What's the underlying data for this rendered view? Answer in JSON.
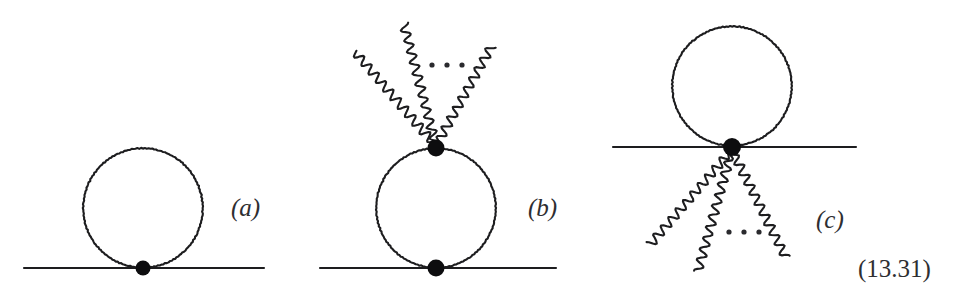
{
  "figure": {
    "kind": "feynman-diagram-figure",
    "equation_number": "(13.31)",
    "background_color": "#ffffff",
    "ink_color": "#1d1d1f",
    "vertex_color": "#0d0d0f",
    "width": 957,
    "height": 303,
    "panels": [
      {
        "id": "a",
        "label": "(a)",
        "description": "tadpole: fermion loop attached to a straight propagator line at a single vertex",
        "straight_line": {
          "x1": 24,
          "y1": 268,
          "x2": 264,
          "y2": 268
        },
        "loop": {
          "cx": 143,
          "cy": 208,
          "r": 60
        },
        "vertices": [
          {
            "cx": 143,
            "cy": 268,
            "r": 7.5
          }
        ],
        "wavy_lines": [],
        "ellipsis": null
      },
      {
        "id": "b",
        "label": "(b)",
        "description": "bubble loop on a propagator line with multiple photon lines radiating upward from the top vertex",
        "straight_line": {
          "x1": 320,
          "y1": 268,
          "x2": 556,
          "y2": 268
        },
        "loop": {
          "cx": 436,
          "cy": 208,
          "r": 60
        },
        "vertices": [
          {
            "cx": 436,
            "cy": 148,
            "r": 8.5
          },
          {
            "cx": 436,
            "cy": 268,
            "r": 8.5
          }
        ],
        "wavy_lines": [
          {
            "x1": 436,
            "y1": 146,
            "x2": 355,
            "y2": 52
          },
          {
            "x1": 436,
            "y1": 146,
            "x2": 404,
            "y2": 24
          },
          {
            "x1": 436,
            "y1": 146,
            "x2": 492,
            "y2": 46
          }
        ],
        "ellipsis": {
          "cx": 447,
          "cy": 65,
          "dots": 3,
          "spacing": 15,
          "r": 2.6
        }
      },
      {
        "id": "c",
        "label": "(c)",
        "description": "tadpole loop above a propagator line with multiple photon lines radiating downward from the vertex",
        "straight_line": {
          "x1": 613,
          "y1": 147,
          "x2": 856,
          "y2": 147
        },
        "loop": {
          "cx": 732,
          "cy": 86,
          "r": 60
        },
        "vertices": [
          {
            "cx": 732,
            "cy": 147,
            "r": 9
          }
        ],
        "wavy_lines": [
          {
            "x1": 732,
            "y1": 150,
            "x2": 650,
            "y2": 245
          },
          {
            "x1": 732,
            "y1": 150,
            "x2": 698,
            "y2": 272
          },
          {
            "x1": 732,
            "y1": 150,
            "x2": 786,
            "y2": 258
          }
        ],
        "ellipsis": {
          "cx": 744,
          "cy": 232,
          "dots": 3,
          "spacing": 15,
          "r": 2.6
        }
      }
    ]
  }
}
